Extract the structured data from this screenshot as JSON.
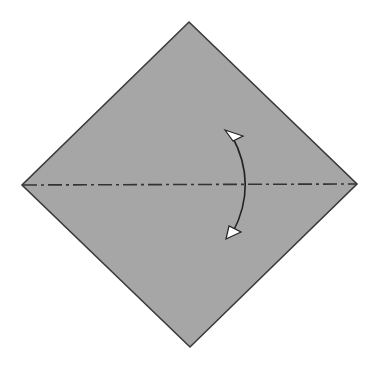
{
  "diagram": {
    "type": "origami-fold-step",
    "paper": {
      "shape": "square-rotated-diamond",
      "fill": "#a6a6a6",
      "stroke": "#3a3a3a",
      "vertices": {
        "top": [
          189,
          22
        ],
        "right": [
          357,
          184
        ],
        "bottom": [
          190,
          347
        ],
        "left": [
          22,
          185
        ]
      }
    },
    "fold_line": {
      "style": "mountain-fold-dash-dot",
      "color": "#333333",
      "from": [
        22,
        185
      ],
      "to": [
        357,
        184
      ]
    },
    "arrow": {
      "meaning": "fold-and-unfold",
      "color": "#222222",
      "head_fill": "#ffffff"
    }
  }
}
